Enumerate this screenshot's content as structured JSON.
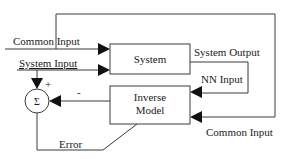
{
  "diagram": {
    "blocks": {
      "system": "System",
      "inverse_model_line1": "Inverse",
      "inverse_model_line2": "Model",
      "summer": "Σ"
    },
    "labels": {
      "common_input_left": "Common Input",
      "system_input": "System  Input",
      "system_output": "System Output",
      "nn_input": "NN Input",
      "common_input_right": "Common Input",
      "error": "Error",
      "plus": "+",
      "minus": "-"
    }
  }
}
